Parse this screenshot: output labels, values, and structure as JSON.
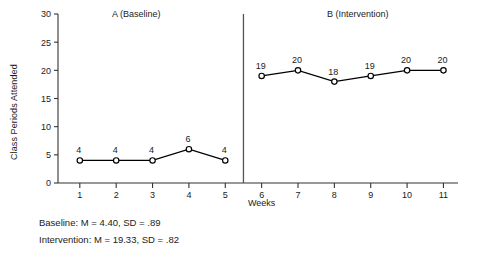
{
  "chart_data": {
    "type": "line",
    "title": "",
    "xlabel": "Weeks",
    "ylabel": "Class Periods Attended",
    "xlim": [
      0.4,
      11.4
    ],
    "ylim": [
      0,
      30
    ],
    "yticks": [
      0,
      5,
      10,
      15,
      20,
      25,
      30
    ],
    "xticks": [
      1,
      2,
      3,
      4,
      5,
      6,
      7,
      8,
      9,
      10,
      11
    ],
    "grid": false,
    "legend": "none",
    "marker": "open-circle",
    "line_color": "#000000",
    "phase_divider_x": 5.5,
    "phases": [
      {
        "name": "A (Baseline)",
        "label": "A (Baseline)",
        "x": [
          1,
          2,
          3,
          4,
          5
        ],
        "values": [
          4,
          4,
          4,
          6,
          4
        ],
        "point_labels": [
          "4",
          "4",
          "4",
          "6",
          "4"
        ]
      },
      {
        "name": "B (Intervention)",
        "label": "B (Intervention)",
        "x": [
          6,
          7,
          8,
          9,
          10,
          11
        ],
        "values": [
          19,
          20,
          18,
          19,
          20,
          20
        ],
        "point_labels": [
          "19",
          "20",
          "18",
          "19",
          "20",
          "20"
        ]
      }
    ],
    "annotations": [
      "Baseline: M = 4.40, SD = .89",
      "Intervention: M = 19.33, SD = .82"
    ]
  },
  "stats": {
    "baseline": "Baseline: M = 4.40, SD = .89",
    "intervention": "Intervention: M = 19.33, SD = .82"
  }
}
